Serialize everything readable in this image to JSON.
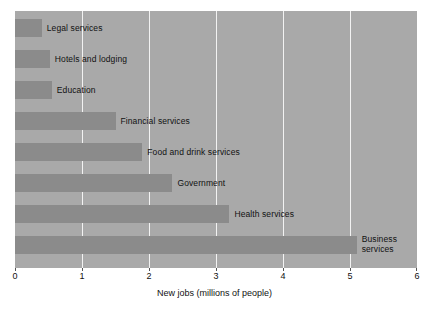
{
  "chart_data": {
    "type": "bar",
    "orientation": "horizontal",
    "title": "",
    "xlabel": "New jobs (millions of people)",
    "ylabel": "",
    "xlim": [
      0,
      6
    ],
    "xticks": [
      "0",
      "1",
      "2",
      "3",
      "4",
      "5",
      "6"
    ],
    "gridlines": [
      "1",
      "2",
      "3",
      "4",
      "5"
    ],
    "grid": true,
    "legend": false,
    "categories": [
      "Legal services",
      "Hotels and lodging",
      "Education",
      "Financial services",
      "Food and drink services",
      "Government",
      "Health services",
      "Business services"
    ],
    "values": [
      0.4,
      0.52,
      0.55,
      1.5,
      1.9,
      2.35,
      3.2,
      5.1
    ],
    "labels_inside_plot": true,
    "colors": {
      "plot_background": "#a9a9a9",
      "bar_fill": "#8b8b8b",
      "gridline": "#f2f2f2",
      "text": "#111111",
      "page_background": "#ffffff"
    }
  },
  "axis": {
    "title": "New jobs (millions of people)",
    "tick_labels": [
      "0",
      "1",
      "2",
      "3",
      "4",
      "5",
      "6"
    ]
  },
  "bars": [
    {
      "label": "Legal services",
      "value": 0.4
    },
    {
      "label": "Hotels and lodging",
      "value": 0.52
    },
    {
      "label": "Education",
      "value": 0.55
    },
    {
      "label": "Financial services",
      "value": 1.5
    },
    {
      "label": "Food and drink services",
      "value": 1.9
    },
    {
      "label": "Government",
      "value": 2.35
    },
    {
      "label": "Health services",
      "value": 3.2
    },
    {
      "label": "Business services",
      "value": 5.1
    }
  ]
}
